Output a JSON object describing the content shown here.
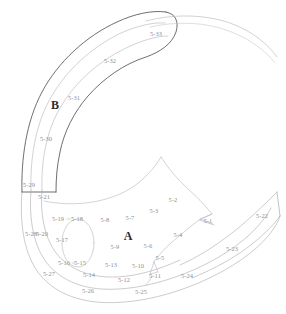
{
  "figure": {
    "caption": "",
    "width": 286,
    "height": 314,
    "background_color": "#ffffff",
    "colors": {
      "outline_dark": "#4a4a4d",
      "outline_light": "#b9b9bd",
      "outline_mid": "#9a9a9e",
      "label_text": "#8e8e90",
      "zone_text": "#2b2b2b"
    }
  },
  "zones": [
    {
      "id": "zone-a",
      "label": "A",
      "x": 128,
      "y": 236
    },
    {
      "id": "zone-b",
      "label": "B",
      "x": 55,
      "y": 105
    }
  ],
  "region_labels": [
    {
      "id": "5-1",
      "label": "5-1",
      "x": 208,
      "y": 221
    },
    {
      "id": "5-2",
      "label": "5-2",
      "x": 173,
      "y": 200
    },
    {
      "id": "5-3",
      "label": "5-3",
      "x": 154,
      "y": 211
    },
    {
      "id": "5-4",
      "label": "5-4",
      "x": 178,
      "y": 235
    },
    {
      "id": "5-5",
      "label": "5-5",
      "x": 160,
      "y": 258
    },
    {
      "id": "5-6",
      "label": "5-6",
      "x": 148,
      "y": 246
    },
    {
      "id": "5-7",
      "label": "5-7",
      "x": 130,
      "y": 218
    },
    {
      "id": "5-8",
      "label": "5-8",
      "x": 105,
      "y": 220
    },
    {
      "id": "5-9",
      "label": "5-9",
      "x": 115,
      "y": 247
    },
    {
      "id": "5-10",
      "label": "5-10",
      "x": 138,
      "y": 266
    },
    {
      "id": "5-11",
      "label": "5-11",
      "x": 155,
      "y": 276
    },
    {
      "id": "5-12",
      "label": "5-12",
      "x": 124,
      "y": 280
    },
    {
      "id": "5-13",
      "label": "5-13",
      "x": 111,
      "y": 265
    },
    {
      "id": "5-14",
      "label": "5-14",
      "x": 89,
      "y": 275
    },
    {
      "id": "5-15",
      "label": "5-15",
      "x": 80,
      "y": 263
    },
    {
      "id": "5-16",
      "label": "5-16",
      "x": 64,
      "y": 263
    },
    {
      "id": "5-17",
      "label": "5-17",
      "x": 62,
      "y": 240
    },
    {
      "id": "5-18",
      "label": "5-18",
      "x": 77,
      "y": 219
    },
    {
      "id": "5-19",
      "label": "5-19",
      "x": 58,
      "y": 219
    },
    {
      "id": "5-20",
      "label": "5-20",
      "x": 42,
      "y": 234
    },
    {
      "id": "5-21",
      "label": "5-21",
      "x": 44,
      "y": 197
    },
    {
      "id": "5-22",
      "label": "5-22",
      "x": 262,
      "y": 216
    },
    {
      "id": "5-23",
      "label": "5-23",
      "x": 232,
      "y": 249
    },
    {
      "id": "5-24",
      "label": "5-24",
      "x": 187,
      "y": 276
    },
    {
      "id": "5-25",
      "label": "5-25",
      "x": 141,
      "y": 292
    },
    {
      "id": "5-26",
      "label": "5-26",
      "x": 88,
      "y": 291
    },
    {
      "id": "5-27",
      "label": "5-27",
      "x": 49,
      "y": 274
    },
    {
      "id": "5-28",
      "label": "5-28",
      "x": 31,
      "y": 234
    },
    {
      "id": "5-29",
      "label": "5-29",
      "x": 29,
      "y": 185
    },
    {
      "id": "5-30",
      "label": "5-30",
      "x": 46,
      "y": 139
    },
    {
      "id": "5-31",
      "label": "5-31",
      "x": 74,
      "y": 98
    },
    {
      "id": "5-32",
      "label": "5-32",
      "x": 110,
      "y": 61
    },
    {
      "id": "5-33",
      "label": "5-33",
      "x": 156,
      "y": 34
    }
  ]
}
